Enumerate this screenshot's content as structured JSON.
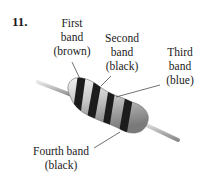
{
  "problem_number": "11.",
  "labels": {
    "first": {
      "line1": "First",
      "line2": "band",
      "line3": "(brown)"
    },
    "second": {
      "line1": "Second",
      "line2": "band",
      "line3": "(black)"
    },
    "third": {
      "line1": "Third",
      "line2": "band",
      "line3": "(blue)"
    },
    "fourth": {
      "line1": "Fourth band",
      "line2": "(black)"
    }
  },
  "colors": {
    "body": "#c8c8c8",
    "band": "#1c1c1c",
    "lead": "#a8a8a8"
  }
}
